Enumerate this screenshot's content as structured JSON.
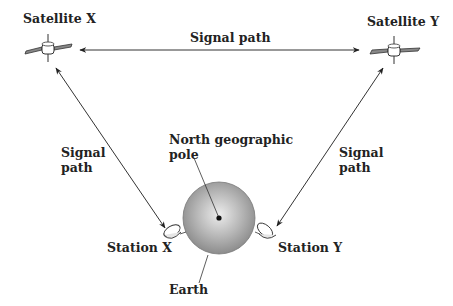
{
  "diagram": {
    "labels": {
      "satellite_x": "Satellite X",
      "satellite_y": "Satellite Y",
      "signal_path_top": "Signal path",
      "signal_path_left_line1": "Signal",
      "signal_path_left_line2": "path",
      "signal_path_right_line1": "Signal",
      "signal_path_right_line2": "path",
      "north_pole_line1": "North geographic",
      "north_pole_line2": "pole",
      "station_x": "Station X",
      "station_y": "Station Y",
      "earth": "Earth"
    },
    "colors": {
      "line": "#333333",
      "earth_center": "#e8e8e8",
      "earth_edge": "#8a8a8a",
      "pole_dot": "#111111"
    }
  }
}
